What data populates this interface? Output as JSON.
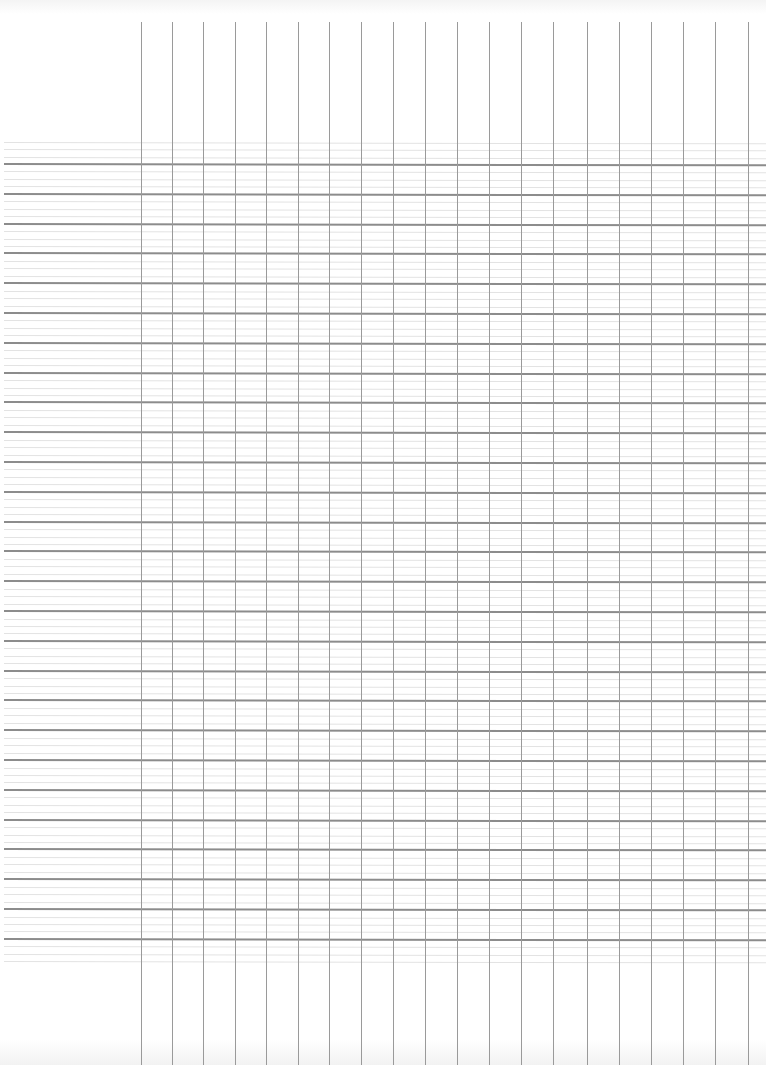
{
  "sheet": {
    "type": "blank-ledger-grid",
    "vertical_lines": {
      "count": 20,
      "x_positions": [
        141,
        172,
        203,
        235,
        266,
        298,
        329,
        361,
        393,
        425,
        457,
        489,
        521,
        553,
        587,
        619,
        651,
        683,
        715,
        748
      ],
      "top": 22,
      "color": "#9a9a9a"
    },
    "horizontal_dark_lines": {
      "first_y": 164,
      "spacing": 29.8,
      "count": 27,
      "color": "#8c8c8c"
    },
    "horizontal_faint_lines": {
      "per_band": 3,
      "first_y": 142,
      "color": "#e3e3e3"
    },
    "colors": {
      "paper": "#ffffff",
      "dark_rule": "#8c8c8c",
      "faint_rule": "#e3e3e3",
      "column_rule": "#9a9a9a"
    }
  }
}
